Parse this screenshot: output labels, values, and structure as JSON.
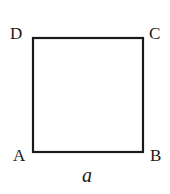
{
  "diagram": {
    "shape": "square",
    "stroke_color": "#1a1a1a",
    "vertices": [
      {
        "label": "A",
        "position": "bottom-left"
      },
      {
        "label": "B",
        "position": "bottom-right"
      },
      {
        "label": "C",
        "position": "top-right"
      },
      {
        "label": "D",
        "position": "top-left"
      }
    ],
    "side_label": "a"
  }
}
